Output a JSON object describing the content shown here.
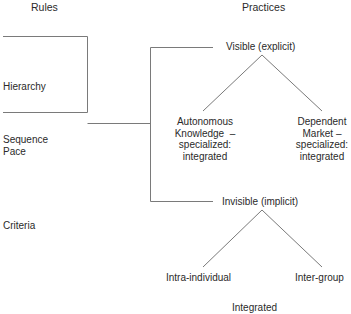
{
  "headers": {
    "rules": "Rules",
    "practices": "Practices"
  },
  "rules": {
    "items": [
      "Hierarchy",
      "Sequence",
      "Pace",
      "Criteria"
    ]
  },
  "practices": {
    "visible": {
      "label": "Visible (explicit)",
      "children": [
        {
          "line1": "Autonomous",
          "line2": "Knowledge  –",
          "line3": "specialized:",
          "line4": "integrated"
        },
        {
          "line1": "Dependent",
          "line2": "Market –",
          "line3": "specialized:",
          "line4": "integrated"
        }
      ]
    },
    "invisible": {
      "label": "Invisible (implicit)",
      "children": [
        "Intra-individual",
        "Inter-group"
      ]
    }
  },
  "footer_partial": "Integrated",
  "colors": {
    "line": "#7a7a7a",
    "text": "#2a2a2a"
  }
}
